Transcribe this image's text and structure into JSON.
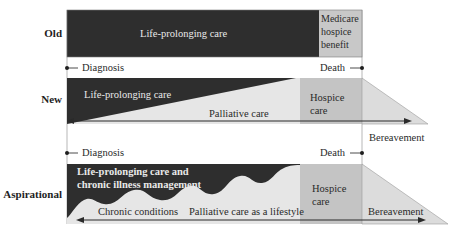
{
  "rows": {
    "old": {
      "label": "Old",
      "life_prolonging": "Life-prolonging care",
      "hospice_line1": "Medicare",
      "hospice_line2": "hospice",
      "hospice_line3": "benefit"
    },
    "new": {
      "label": "New",
      "life_prolonging": "Life-prolonging care",
      "palliative": "Palliative care",
      "hospice_line1": "Hospice",
      "hospice_line2": "care",
      "bereavement": "Bereavement"
    },
    "aspirational": {
      "label": "Aspirational",
      "life_prolonging_line1": "Life-prolonging care and",
      "life_prolonging_line2": "chronic illness management",
      "chronic": "Chronic conditions",
      "palliative": "Palliative care as a lifestyle",
      "hospice_line1": "Hospice",
      "hospice_line2": "care",
      "bereavement": "Bereavement"
    }
  },
  "markers": {
    "diagnosis": "Diagnosis",
    "death": "Death"
  },
  "colors": {
    "dark_fill": "#2e2e2e",
    "light_fill": "#e6e6e6",
    "hospice_fill": "#c4c4c4",
    "bereavement_fill": "#dcdcdc",
    "line": "#3a3a3a"
  }
}
